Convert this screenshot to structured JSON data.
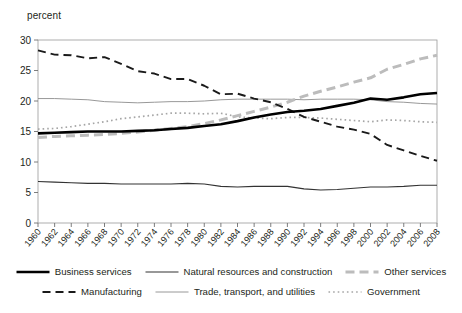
{
  "chart_data": {
    "type": "line",
    "title": "",
    "xlabel": "",
    "ylabel": "percent",
    "ylim": [
      0,
      30
    ],
    "yticks": [
      0,
      5,
      10,
      15,
      20,
      25,
      30
    ],
    "grid": false,
    "legend_position": "bottom",
    "x": [
      1960,
      1962,
      1964,
      1966,
      1968,
      1970,
      1972,
      1974,
      1976,
      1978,
      1980,
      1982,
      1984,
      1986,
      1988,
      1990,
      1992,
      1994,
      1996,
      1998,
      2000,
      2002,
      2004,
      2006,
      2008
    ],
    "categories": [
      "1960",
      "1962",
      "1964",
      "1966",
      "1968",
      "1970",
      "1972",
      "1974",
      "1976",
      "1978",
      "1980",
      "1982",
      "1984",
      "1986",
      "1988",
      "1990",
      "1992",
      "1994",
      "1996",
      "1998",
      "2000",
      "2002",
      "2004",
      "2006",
      "2008"
    ],
    "series": [
      {
        "name": "Business services",
        "style": "solid-thick-black",
        "color": "#000000",
        "values": [
          14.7,
          14.8,
          14.9,
          15.0,
          15.0,
          15.0,
          15.1,
          15.2,
          15.4,
          15.6,
          15.9,
          16.2,
          16.7,
          17.3,
          17.8,
          18.2,
          18.4,
          18.7,
          19.2,
          19.7,
          20.4,
          20.2,
          20.6,
          21.1,
          21.3
        ]
      },
      {
        "name": "Natural resources and construction",
        "style": "solid-thin-black",
        "color": "#333333",
        "values": [
          6.8,
          6.7,
          6.6,
          6.5,
          6.5,
          6.4,
          6.4,
          6.4,
          6.4,
          6.5,
          6.4,
          6.0,
          5.9,
          6.0,
          6.0,
          6.0,
          5.6,
          5.4,
          5.5,
          5.7,
          5.9,
          5.9,
          6.0,
          6.2,
          6.2
        ]
      },
      {
        "name": "Other services",
        "style": "dashed-thick-gray",
        "color": "#bcbcbc",
        "values": [
          14.0,
          14.2,
          14.3,
          14.4,
          14.5,
          14.7,
          14.9,
          15.2,
          15.5,
          15.8,
          16.3,
          16.9,
          17.6,
          18.3,
          19.0,
          19.8,
          20.8,
          21.6,
          22.3,
          23.1,
          23.8,
          25.2,
          26.0,
          26.9,
          27.5
        ]
      },
      {
        "name": "Manufacturing",
        "style": "dashed-black",
        "color": "#1a1a1a",
        "values": [
          28.3,
          27.6,
          27.5,
          27.0,
          27.2,
          26.1,
          24.9,
          24.5,
          23.6,
          23.6,
          22.5,
          21.1,
          21.2,
          20.4,
          19.8,
          18.7,
          17.4,
          16.6,
          15.8,
          15.3,
          14.6,
          12.8,
          11.9,
          11.0,
          10.2
        ]
      },
      {
        "name": "Trade, transport, and utilities",
        "style": "solid-thin-gray",
        "color": "#8c8c8c",
        "values": [
          20.4,
          20.4,
          20.3,
          20.2,
          19.9,
          19.8,
          19.7,
          19.8,
          19.9,
          19.9,
          20.0,
          20.2,
          20.3,
          20.3,
          20.3,
          20.3,
          20.2,
          20.3,
          20.3,
          20.3,
          20.2,
          19.9,
          19.8,
          19.6,
          19.5
        ]
      },
      {
        "name": "Government",
        "style": "dotted-gray",
        "color": "#a6a6a6",
        "values": [
          15.4,
          15.5,
          15.8,
          16.2,
          16.6,
          17.1,
          17.4,
          17.7,
          18.0,
          18.0,
          17.9,
          18.0,
          17.4,
          17.2,
          17.1,
          17.3,
          17.3,
          17.2,
          17.0,
          16.8,
          16.6,
          16.9,
          16.8,
          16.6,
          16.5
        ]
      }
    ]
  },
  "legend": {
    "row1": [
      {
        "label": "Business services",
        "swatch": "solid-thick-black"
      },
      {
        "label": "Natural resources and construction",
        "swatch": "solid-thin-black"
      },
      {
        "label": "Other services",
        "swatch": "dashed-thick-gray"
      }
    ],
    "row2": [
      {
        "label": "Manufacturing",
        "swatch": "dashed-black"
      },
      {
        "label": "Trade, transport, and utilities",
        "swatch": "solid-thin-gray"
      },
      {
        "label": "Government",
        "swatch": "dotted-gray"
      }
    ]
  }
}
